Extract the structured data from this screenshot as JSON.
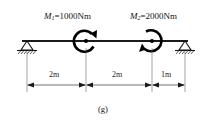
{
  "figure": {
    "caption": "(g)",
    "type": "simply-supported-beam-with-moments"
  },
  "moments": [
    {
      "id": "M1",
      "symbol": "M",
      "subscript": "1",
      "equals": "=",
      "value": "1000Nm",
      "full_label": "M1=1000Nm",
      "sense": "clockwise-arrow-right",
      "position_m": 2
    },
    {
      "id": "M2",
      "symbol": "M",
      "subscript": "2",
      "equals": "=",
      "value": "2000Nm",
      "full_label": "M2=2000Nm",
      "sense": "counterclockwise-arrow-left",
      "position_m": 4
    }
  ],
  "supports": [
    {
      "id": "left-support",
      "kind": "pin-triangle-hatched",
      "position_m": 0
    },
    {
      "id": "right-support",
      "kind": "pin-triangle-hatched",
      "position_m": 5
    }
  ],
  "dimensions": [
    {
      "id": "dim-1",
      "label": "2m",
      "from_m": 0,
      "to_m": 2
    },
    {
      "id": "dim-2",
      "label": "2m",
      "from_m": 2,
      "to_m": 4
    },
    {
      "id": "dim-3",
      "label": "1m",
      "from_m": 4,
      "to_m": 5
    }
  ],
  "colors": {
    "ink": "#111111",
    "beam": "#1a1a1a",
    "dimension": "#555555",
    "background": "#ffffff"
  }
}
